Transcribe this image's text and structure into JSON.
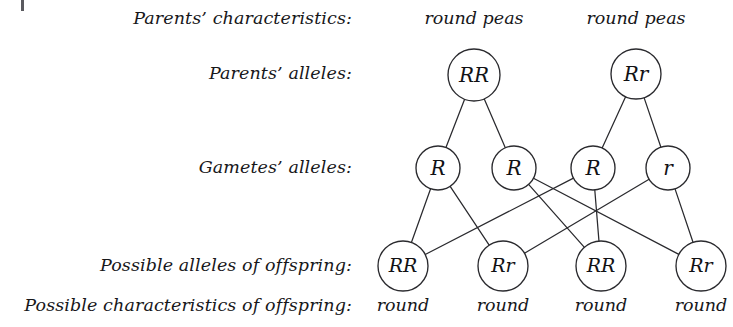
{
  "diagram": {
    "stroke_color": "#2a2a2e",
    "text_color": "#17171a",
    "background": "#ffffff",
    "row_labels": [
      {
        "id": "parents-characteristics",
        "text": "Parents’ characteristics:",
        "x": 352,
        "y": 24
      },
      {
        "id": "parents-alleles",
        "text": "Parents’ alleles:",
        "x": 352,
        "y": 79
      },
      {
        "id": "gametes-alleles",
        "text": "Gametes’ alleles:",
        "x": 352,
        "y": 173
      },
      {
        "id": "possible-alleles-offspring",
        "text": "Possible alleles of offspring:",
        "x": 352,
        "y": 271
      },
      {
        "id": "possible-characteristics-offspring",
        "text": "Possible characteristics of offspring:",
        "x": 352,
        "y": 311
      }
    ],
    "parent_phenotypes": [
      {
        "id": "parent-1-phenotype",
        "text": "round peas",
        "x": 474,
        "y": 24
      },
      {
        "id": "parent-2-phenotype",
        "text": "round peas",
        "x": 636,
        "y": 24
      }
    ],
    "parents": [
      {
        "id": "parent-1",
        "genotype": "RR",
        "cx": 474,
        "cy": 75,
        "r": 26
      },
      {
        "id": "parent-2",
        "genotype": "Rr",
        "cx": 636,
        "cy": 74,
        "r": 25
      }
    ],
    "gametes": [
      {
        "id": "gamete-1",
        "allele": "R",
        "cx": 438,
        "cy": 168,
        "r": 22
      },
      {
        "id": "gamete-2",
        "allele": "R",
        "cx": 514,
        "cy": 168,
        "r": 22
      },
      {
        "id": "gamete-3",
        "allele": "R",
        "cx": 593,
        "cy": 168,
        "r": 22
      },
      {
        "id": "gamete-4",
        "allele": "r",
        "cx": 668,
        "cy": 168,
        "r": 22
      }
    ],
    "offspring": [
      {
        "id": "offspring-1",
        "genotype": "RR",
        "phenotype": "round",
        "cx": 403,
        "cy": 266,
        "r": 25
      },
      {
        "id": "offspring-2",
        "genotype": "Rr",
        "phenotype": "round",
        "cx": 503,
        "cy": 266,
        "r": 25
      },
      {
        "id": "offspring-3",
        "genotype": "RR",
        "phenotype": "round",
        "cx": 601,
        "cy": 266,
        "r": 25
      },
      {
        "id": "offspring-4",
        "genotype": "Rr",
        "phenotype": "round",
        "cx": 701,
        "cy": 266,
        "r": 25
      }
    ],
    "offspring_phenotype_y": 311,
    "parent_to_gamete_links": [
      {
        "id": "link-parent1-gamete1",
        "from": "parent-1",
        "to": "gamete-1"
      },
      {
        "id": "link-parent1-gamete2",
        "from": "parent-1",
        "to": "gamete-2"
      },
      {
        "id": "link-parent2-gamete3",
        "from": "parent-2",
        "to": "gamete-3"
      },
      {
        "id": "link-parent2-gamete4",
        "from": "parent-2",
        "to": "gamete-4"
      }
    ],
    "gamete_to_offspring_links": [
      {
        "id": "link-gamete1-offspring1",
        "from": "gamete-1",
        "to": "offspring-1"
      },
      {
        "id": "link-gamete1-offspring2",
        "from": "gamete-1",
        "to": "offspring-2"
      },
      {
        "id": "link-gamete2-offspring3",
        "from": "gamete-2",
        "to": "offspring-3"
      },
      {
        "id": "link-gamete2-offspring4",
        "from": "gamete-2",
        "to": "offspring-4"
      },
      {
        "id": "link-gamete3-offspring1",
        "from": "gamete-3",
        "to": "offspring-1"
      },
      {
        "id": "link-gamete3-offspring3",
        "from": "gamete-3",
        "to": "offspring-3"
      },
      {
        "id": "link-gamete4-offspring2",
        "from": "gamete-4",
        "to": "offspring-2"
      },
      {
        "id": "link-gamete4-offspring4",
        "from": "gamete-4",
        "to": "offspring-4"
      }
    ],
    "corner_mark": {
      "x": 21,
      "y": 0,
      "width": 3,
      "height": 11
    }
  }
}
